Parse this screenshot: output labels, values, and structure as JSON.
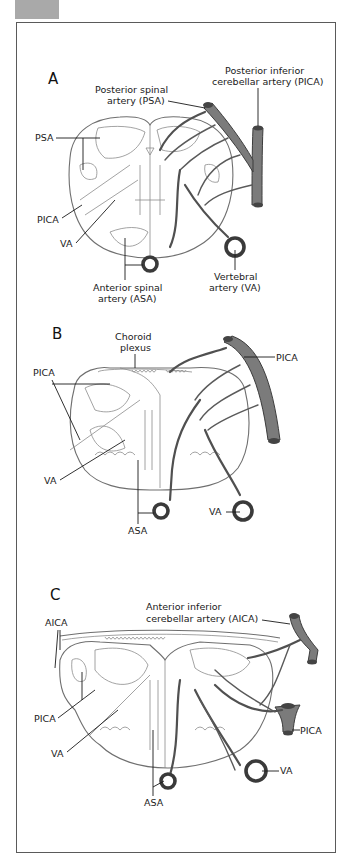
{
  "figure": {
    "corner_tab_color": "#a9a9a9",
    "artery_fill_color": "#7b7b7b",
    "outline_color": "#6f6f6f"
  },
  "panels": [
    {
      "id": "A",
      "letter": "A",
      "labels": {
        "pica_title_line1": "Posterior inferior",
        "pica_title_line2": "cerebellar artery (PICA)",
        "psa_title_line1": "Posterior spinal",
        "psa_title_line2": "artery (PSA)",
        "psa_left": "PSA",
        "pica_left": "PICA",
        "va_left": "VA",
        "asa_line1": "Anterior spinal",
        "asa_line2": "artery (ASA)",
        "va_line1": "Vertebral",
        "va_line2": "artery (VA)"
      }
    },
    {
      "id": "B",
      "letter": "B",
      "labels": {
        "choroid_line1": "Choroid",
        "choroid_line2": "plexus",
        "pica_right": "PICA",
        "pica_left": "PICA",
        "va_left": "VA",
        "asa": "ASA",
        "va_right": "VA"
      }
    },
    {
      "id": "C",
      "letter": "C",
      "labels": {
        "aica_title_line1": "Anterior inferior",
        "aica_title_line2": "cerebellar artery (AICA)",
        "aica_left": "AICA",
        "pica_left": "PICA",
        "va_left": "VA",
        "asa": "ASA",
        "pica_right": "PICA",
        "va_right": "VA"
      }
    }
  ]
}
